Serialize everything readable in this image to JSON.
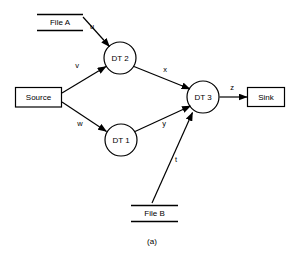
{
  "figure": {
    "caption": "(a)",
    "width": 300,
    "height": 258,
    "background_color": "#ffffff",
    "stroke_color": "#000000"
  },
  "nodes": {
    "file_a": {
      "label": "File A",
      "shape": "open-box",
      "x": 60,
      "y": 22
    },
    "file_b": {
      "label": "File B",
      "shape": "open-box",
      "x": 154,
      "y": 213
    },
    "source": {
      "label": "Source",
      "shape": "rectangle",
      "x": 38,
      "y": 97
    },
    "sink": {
      "label": "Sink",
      "shape": "rectangle",
      "x": 266,
      "y": 97
    },
    "dt1": {
      "label": "DT 1",
      "shape": "circle",
      "x": 121,
      "y": 140
    },
    "dt2": {
      "label": "DT 2",
      "shape": "circle",
      "x": 120,
      "y": 58
    },
    "dt3": {
      "label": "DT 3",
      "shape": "circle",
      "x": 203,
      "y": 97
    }
  },
  "edges": [
    {
      "id": "u",
      "label": "u",
      "from": "file_a",
      "to": "dt2",
      "label_x": 92,
      "label_y": 27
    },
    {
      "id": "v",
      "label": "v",
      "from": "source",
      "to": "dt2",
      "label_x": 77,
      "label_y": 66
    },
    {
      "id": "w",
      "label": "w",
      "from": "source",
      "to": "dt1",
      "label_x": 80,
      "label_y": 124
    },
    {
      "id": "x",
      "label": "x",
      "from": "dt2",
      "to": "dt3",
      "label_x": 165,
      "label_y": 70
    },
    {
      "id": "y",
      "label": "y",
      "from": "dt1",
      "to": "dt3",
      "label_x": 164,
      "label_y": 124
    },
    {
      "id": "t",
      "label": "t",
      "from": "file_b",
      "to": "dt3",
      "label_x": 176,
      "label_y": 160
    },
    {
      "id": "z",
      "label": "z",
      "from": "dt3",
      "to": "sink",
      "label_x": 232,
      "label_y": 88
    }
  ]
}
